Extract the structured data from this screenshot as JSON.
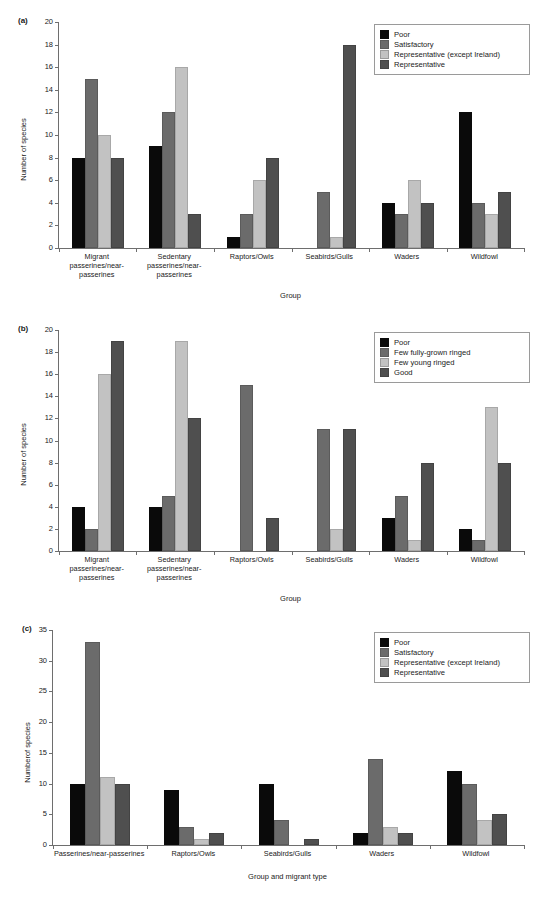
{
  "figure": {
    "panels": [
      "(a)",
      "(b)",
      "(c)"
    ]
  },
  "chart_data": [
    {
      "panel": "(a)",
      "type": "bar",
      "title": "",
      "xlabel": "Group",
      "ylabel": "Number of species",
      "ylim": [
        0,
        20
      ],
      "yticks": [
        "0",
        "2",
        "4",
        "6",
        "8",
        "10",
        "12",
        "14",
        "16",
        "18",
        "20"
      ],
      "grid": false,
      "legend_position": "top-right",
      "categories": [
        "Migrant\npasserines/near-\npasserines",
        "Sedentary\npasserines/near-\npasserines",
        "Raptors/Owls",
        "Seabirds/Gulls",
        "Waders",
        "Wildfowl"
      ],
      "category_lines": [
        [
          "Migrant",
          "passerines/near-",
          "passerines"
        ],
        [
          "Sedentary",
          "passerines/near-",
          "passerines"
        ],
        [
          "Raptors/Owls"
        ],
        [
          "Seabirds/Gulls"
        ],
        [
          "Waders"
        ],
        [
          "Wildfowl"
        ]
      ],
      "series": [
        {
          "name": "Poor",
          "color": "#0a0a0a",
          "values": [
            8,
            9,
            1,
            0,
            4,
            12
          ]
        },
        {
          "name": "Satisfactory",
          "color": "#6b6b6b",
          "values": [
            15,
            12,
            3,
            5,
            3,
            4
          ]
        },
        {
          "name": "Representative (except Ireland)",
          "color": "#c2c2c2",
          "values": [
            10,
            16,
            6,
            1,
            6,
            3
          ]
        },
        {
          "name": "Representative",
          "color": "#4f4f4f",
          "values": [
            8,
            3,
            8,
            18,
            4,
            5
          ]
        }
      ]
    },
    {
      "panel": "(b)",
      "type": "bar",
      "title": "",
      "xlabel": "Group",
      "ylabel": "Number of species",
      "ylim": [
        0,
        20
      ],
      "yticks": [
        "0",
        "2",
        "4",
        "6",
        "8",
        "10",
        "12",
        "14",
        "16",
        "18",
        "20"
      ],
      "grid": false,
      "legend_position": "top-right",
      "categories": [
        "Migrant\npasserines/near-\npasserines",
        "Sedentary\npasserines/near-\npasserines",
        "Raptors/Owls",
        "Seabirds/Gulls",
        "Waders",
        "Wildfowl"
      ],
      "category_lines": [
        [
          "Migrant",
          "passerines/near-",
          "passerines"
        ],
        [
          "Sedentary",
          "passerines/near-",
          "passerines"
        ],
        [
          "Raptors/Owls"
        ],
        [
          "Seabirds/Gulls"
        ],
        [
          "Waders"
        ],
        [
          "Wildfowl"
        ]
      ],
      "series": [
        {
          "name": "Poor",
          "color": "#0a0a0a",
          "values": [
            4,
            4,
            0,
            0,
            3,
            2
          ]
        },
        {
          "name": "Few fully-grown ringed",
          "color": "#6b6b6b",
          "values": [
            2,
            5,
            15,
            11,
            5,
            1
          ]
        },
        {
          "name": "Few young ringed",
          "color": "#c2c2c2",
          "values": [
            16,
            19,
            0,
            2,
            1,
            13
          ]
        },
        {
          "name": "Good",
          "color": "#4f4f4f",
          "values": [
            19,
            12,
            3,
            11,
            8,
            8
          ]
        }
      ]
    },
    {
      "panel": "(c)",
      "type": "bar",
      "title": "",
      "xlabel": "Group and migrant type",
      "ylabel": "Numberof species",
      "ylim": [
        0,
        35
      ],
      "yticks": [
        "0",
        "5",
        "10",
        "15",
        "20",
        "25",
        "30",
        "35"
      ],
      "grid": false,
      "legend_position": "top-right",
      "categories": [
        "Passerines/near-passerines",
        "Raptors/Owls",
        "Seabirds/Gulls",
        "Waders",
        "Wildfowl"
      ],
      "category_lines": [
        [
          "Passerines/near-passerines"
        ],
        [
          "Raptors/Owls"
        ],
        [
          "Seabirds/Gulls"
        ],
        [
          "Waders"
        ],
        [
          "Wildfowl"
        ]
      ],
      "series": [
        {
          "name": "Poor",
          "color": "#0a0a0a",
          "values": [
            10,
            9,
            10,
            2,
            12
          ]
        },
        {
          "name": "Satisfactory",
          "color": "#6b6b6b",
          "values": [
            33,
            3,
            4,
            14,
            10
          ]
        },
        {
          "name": "Representative (except Ireland)",
          "color": "#c2c2c2",
          "values": [
            11,
            1,
            0,
            3,
            4
          ]
        },
        {
          "name": "Representative",
          "color": "#4f4f4f",
          "values": [
            10,
            2,
            1,
            2,
            5
          ]
        }
      ]
    }
  ]
}
